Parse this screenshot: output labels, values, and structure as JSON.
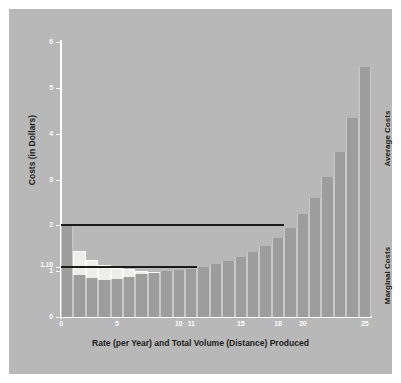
{
  "figure": {
    "background": "#b8b8b8",
    "avg_color": "#ededeb",
    "marginal_color": "#9d9d9d",
    "axis_color": "#ffffff",
    "line_color": "#1a1a1a"
  },
  "labels": {
    "ylabel": "Costs (in Dollars)",
    "xlabel": "Rate (per Year) and Total Volume (Distance) Produced",
    "average_series": "Average Costs",
    "marginal_series": "Marginal Costs"
  },
  "chart_data": {
    "type": "bar",
    "title": "",
    "xlabel": "Rate (per Year) and Total Volume (Distance) Produced",
    "ylabel": "Costs (in Dollars)",
    "xlim": [
      0,
      25
    ],
    "ylim": [
      0,
      6
    ],
    "yticks": [
      0,
      1,
      2,
      3,
      4,
      5,
      6
    ],
    "ytick_labels": [
      "0",
      "1",
      "2",
      "3",
      "4",
      "5",
      "6"
    ],
    "extra_ytick": {
      "value": 1.1,
      "label": "1.10"
    },
    "xticks": [
      0,
      5,
      10,
      11,
      15,
      18,
      20,
      25
    ],
    "xtick_labels": [
      "0",
      "5",
      "10",
      "11",
      "15",
      "18",
      "20",
      "25"
    ],
    "grid": false,
    "legend": "right-side rotated labels",
    "categories": [
      1,
      2,
      3,
      4,
      5,
      6,
      7,
      8,
      9,
      10,
      11,
      12,
      13,
      14,
      15,
      16,
      17,
      18,
      19,
      20,
      21,
      22,
      23,
      24,
      25
    ],
    "series": [
      {
        "name": "Average Costs",
        "color": "#ededeb",
        "values": [
          2.0,
          1.45,
          1.25,
          1.13,
          1.08,
          1.04,
          1.01,
          0.99,
          0.99,
          1.0,
          1.02,
          1.05,
          1.09,
          1.15,
          1.23,
          1.32,
          1.43,
          1.56,
          1.72,
          1.9,
          2.17,
          2.52,
          2.96,
          3.5,
          4.15
        ]
      },
      {
        "name": "Marginal Costs",
        "color": "#9d9d9d",
        "values": [
          2.0,
          0.92,
          0.85,
          0.8,
          0.84,
          0.88,
          0.93,
          0.97,
          1.0,
          1.02,
          1.05,
          1.09,
          1.15,
          1.22,
          1.31,
          1.42,
          1.55,
          1.72,
          1.95,
          2.24,
          2.6,
          3.05,
          3.6,
          4.35,
          5.45
        ]
      }
    ],
    "annotations": [
      {
        "type": "hline",
        "label": "price/average cost reference",
        "y": 2.0,
        "x_start": 0,
        "x_end": 18
      },
      {
        "type": "hline",
        "label": "minimum average cost reference",
        "y": 1.1,
        "x_start": 0,
        "x_end": 11
      }
    ]
  }
}
